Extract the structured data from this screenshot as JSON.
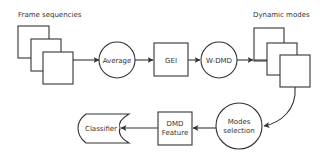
{
  "diagram": {
    "labels": {
      "frame_sequences": "Frame sequencies",
      "dynamic_modes": "Dynamic modes"
    },
    "nodes": {
      "average": "Average",
      "gei": "GEI",
      "wdmd": "W-DMD",
      "modes_selection_line1": "Modes",
      "modes_selection_line2": "selection",
      "dmd_feature_line1": "DMD",
      "dmd_feature_line2": "Feature",
      "classifier": "Classifier"
    },
    "edges": [
      {
        "from": "frame_sequences",
        "to": "average"
      },
      {
        "from": "average",
        "to": "gei"
      },
      {
        "from": "gei",
        "to": "wdmd"
      },
      {
        "from": "wdmd",
        "to": "dynamic_modes"
      },
      {
        "from": "dynamic_modes",
        "to": "modes_selection"
      },
      {
        "from": "modes_selection",
        "to": "dmd_feature"
      },
      {
        "from": "dmd_feature",
        "to": "classifier"
      }
    ],
    "colors": {
      "stroke": "#333333",
      "fill": "#ffffff",
      "text": "#333333"
    }
  }
}
